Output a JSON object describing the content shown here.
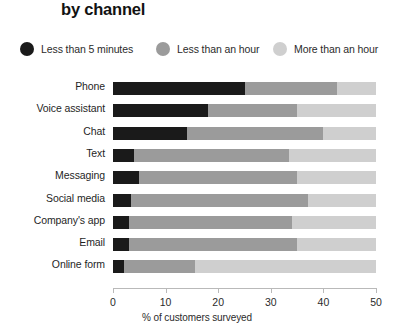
{
  "title": "by channel",
  "legend": {
    "position": "top",
    "items": [
      {
        "label": "Less than 5 minutes",
        "color": "#1a1a1a",
        "left": 0
      },
      {
        "label": "Less than an hour",
        "color": "#9b9b9b",
        "left": 136
      },
      {
        "label": "More than an hour",
        "color": "#cfcfcf",
        "left": 253
      }
    ]
  },
  "axis": {
    "x_title": "% of customers surveyed",
    "ticks": [
      "0",
      "10",
      "20",
      "30",
      "40",
      "50"
    ]
  },
  "chart_data": {
    "type": "bar",
    "orientation": "horizontal",
    "stacked": true,
    "title": "by channel",
    "xlabel": "% of customers surveyed",
    "ylabel": "",
    "xlim": [
      0,
      50
    ],
    "grid": false,
    "legend_position": "top",
    "categories": [
      "Phone",
      "Voice assistant",
      "Chat",
      "Text",
      "Messaging",
      "Social media",
      "Company's app",
      "Email",
      "Online form"
    ],
    "series": [
      {
        "name": "Less than 5 minutes",
        "color": "#1a1a1a",
        "values": [
          25,
          18,
          14,
          4,
          5,
          3.5,
          3,
          3,
          2
        ]
      },
      {
        "name": "Less than an hour",
        "color": "#9b9b9b",
        "values": [
          17.5,
          17,
          26,
          29.5,
          30,
          33.5,
          31,
          32,
          13.5
        ]
      },
      {
        "name": "More than an hour",
        "color": "#cfcfcf",
        "values": [
          7.5,
          15,
          10,
          16.5,
          15,
          13,
          16,
          15,
          34.5
        ]
      }
    ]
  }
}
